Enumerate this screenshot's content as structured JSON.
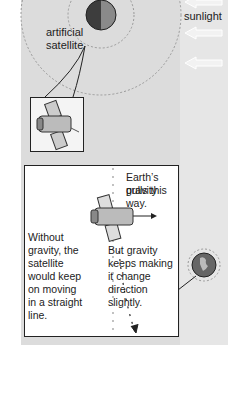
{
  "labels": {
    "sunlight": "sunlight",
    "satellite_line1": "artificial",
    "satellite_line2": "satellite"
  },
  "callout": {
    "gravity_line1": "Earth’s gravity",
    "gravity_line2": "pulls this way.",
    "without_lines": [
      "Without",
      "gravity, the",
      "satellite",
      "would keep",
      "on moving",
      "in a straight",
      "line."
    ],
    "but_lines": [
      "But gravity",
      "keeps making",
      "it change",
      "direction",
      "slightly."
    ]
  },
  "icons": [
    "earth-icon",
    "satellite-icon",
    "sunlight-arrow-icon"
  ],
  "colors": {
    "panel": "#dcdcdc",
    "earth": "#5a5a5a",
    "text": "#222222"
  }
}
